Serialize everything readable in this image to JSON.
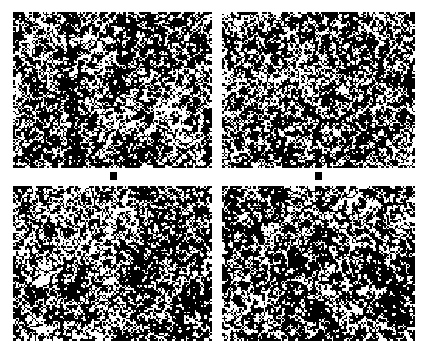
{
  "figure": {
    "type": "binary-texture-panel-grid",
    "width": 429,
    "height": 353,
    "background_color": "#ffffff",
    "foreground_color": "#000000",
    "rows": 2,
    "columns": 2
  },
  "panels": [
    {
      "id": "panel-top-left",
      "name": "top-left",
      "label": "",
      "x": 13,
      "y": 12,
      "width": 199,
      "height": 156,
      "seed": 10427,
      "cell": 1.55,
      "black_fraction": 0.52,
      "cluster_scale": 0.055,
      "cluster_weight": 0.62,
      "cluster_bias": 0.04
    },
    {
      "id": "panel-top-right",
      "name": "top-right",
      "label": "",
      "x": 222,
      "y": 12,
      "width": 193,
      "height": 156,
      "seed": 22831,
      "cell": 1.55,
      "black_fraction": 0.53,
      "cluster_scale": 0.058,
      "cluster_weight": 0.6,
      "cluster_bias": 0.05
    },
    {
      "id": "panel-bottom-left",
      "name": "bottom-left",
      "label": "",
      "x": 13,
      "y": 186,
      "width": 199,
      "height": 155,
      "seed": 38154,
      "cell": 1.55,
      "black_fraction": 0.52,
      "cluster_scale": 0.052,
      "cluster_weight": 0.64,
      "cluster_bias": 0.03
    },
    {
      "id": "panel-bottom-right",
      "name": "bottom-right",
      "label": "",
      "x": 222,
      "y": 186,
      "width": 193,
      "height": 155,
      "seed": 47609,
      "cell": 1.55,
      "black_fraction": 0.53,
      "cluster_scale": 0.06,
      "cluster_weight": 0.61,
      "cluster_bias": 0.05
    }
  ],
  "markers": [
    {
      "id": "marker-left",
      "name": "left-gap-marker",
      "x": 110,
      "y": 172,
      "width": 7,
      "height": 8,
      "color": "#000000"
    },
    {
      "id": "marker-right",
      "name": "right-gap-marker",
      "x": 315,
      "y": 172,
      "width": 7,
      "height": 8,
      "color": "#000000"
    }
  ],
  "chart_data": {
    "type": "heatmap",
    "title": "",
    "subtitle": "",
    "xlabel": "",
    "ylabel": "",
    "legend": [],
    "annotations": [],
    "grid": false,
    "colormap": [
      "#ffffff",
      "#000000"
    ],
    "levels": 2,
    "panel_order": [
      "top-left",
      "top-right",
      "bottom-left",
      "bottom-right"
    ],
    "series": [
      {
        "name": "top-left",
        "black_fraction": 0.52,
        "cell_size_px": 1.55,
        "domain_scale": 0.055
      },
      {
        "name": "top-right",
        "black_fraction": 0.53,
        "cell_size_px": 1.55,
        "domain_scale": 0.058
      },
      {
        "name": "bottom-left",
        "black_fraction": 0.52,
        "cell_size_px": 1.55,
        "domain_scale": 0.052
      },
      {
        "name": "bottom-right",
        "black_fraction": 0.53,
        "cell_size_px": 1.55,
        "domain_scale": 0.06
      }
    ]
  }
}
